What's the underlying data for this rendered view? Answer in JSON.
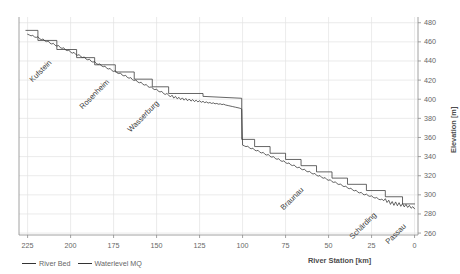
{
  "chart_data": {
    "type": "line",
    "title": "",
    "xlabel": "River Station [km]",
    "ylabel": "Elevation [m]",
    "xlim": [
      230,
      -2
    ],
    "ylim": [
      258,
      486
    ],
    "x_ticks": [
      225,
      200,
      175,
      150,
      125,
      100,
      75,
      50,
      25,
      0
    ],
    "y_ticks": [
      480,
      460,
      440,
      420,
      400,
      380,
      360,
      340,
      320,
      300,
      280,
      260
    ],
    "grid": true,
    "legend_position": "below-left",
    "series": [
      {
        "name": "River Bed",
        "color": "#333333",
        "points": [
          [
            225.0,
            468.0
          ],
          [
            224.0,
            467.2
          ],
          [
            223.0,
            466.3
          ],
          [
            222.0,
            466.8
          ],
          [
            221.0,
            465.2
          ],
          [
            220.0,
            464.6
          ],
          [
            219.0,
            465.4
          ],
          [
            218.0,
            463.2
          ],
          [
            217.0,
            462.4
          ],
          [
            216.0,
            463.0
          ],
          [
            215.0,
            461.0
          ],
          [
            214.0,
            460.2
          ],
          [
            213.0,
            460.8
          ],
          [
            212.0,
            458.6
          ],
          [
            211.0,
            457.8
          ],
          [
            210.0,
            458.4
          ],
          [
            209.0,
            456.4
          ],
          [
            208.0,
            455.6
          ],
          [
            207.0,
            456.2
          ],
          [
            206.0,
            454.0
          ],
          [
            205.0,
            453.2
          ],
          [
            204.0,
            453.8
          ],
          [
            203.0,
            451.6
          ],
          [
            202.0,
            450.8
          ],
          [
            201.0,
            451.4
          ],
          [
            200.0,
            449.2
          ],
          [
            199.0,
            448.2
          ],
          [
            198.0,
            449.0
          ],
          [
            197.0,
            446.8
          ],
          [
            196.0,
            446.0
          ],
          [
            195.0,
            446.6
          ],
          [
            194.0,
            444.4
          ],
          [
            193.0,
            443.6
          ],
          [
            192.0,
            444.2
          ],
          [
            191.0,
            442.0
          ],
          [
            190.0,
            441.2
          ],
          [
            189.0,
            441.8
          ],
          [
            188.0,
            439.6
          ],
          [
            187.0,
            438.8
          ],
          [
            186.0,
            439.4
          ],
          [
            185.0,
            437.2
          ],
          [
            184.0,
            436.4
          ],
          [
            183.0,
            437.0
          ],
          [
            182.0,
            434.8
          ],
          [
            181.0,
            434.0
          ],
          [
            180.0,
            434.6
          ],
          [
            179.0,
            432.4
          ],
          [
            178.0,
            431.6
          ],
          [
            177.0,
            432.2
          ],
          [
            176.0,
            430.0
          ],
          [
            175.0,
            429.0
          ],
          [
            174.0,
            429.8
          ],
          [
            173.0,
            427.6
          ],
          [
            172.0,
            426.8
          ],
          [
            171.0,
            427.4
          ],
          [
            170.0,
            425.2
          ],
          [
            169.0,
            424.4
          ],
          [
            168.0,
            425.0
          ],
          [
            167.0,
            422.8
          ],
          [
            166.0,
            422.0
          ],
          [
            165.0,
            422.6
          ],
          [
            164.0,
            420.4
          ],
          [
            163.0,
            419.6
          ],
          [
            162.0,
            420.2
          ],
          [
            161.0,
            418.0
          ],
          [
            160.0,
            417.2
          ],
          [
            159.0,
            417.8
          ],
          [
            158.0,
            415.6
          ],
          [
            157.0,
            414.8
          ],
          [
            156.0,
            415.4
          ],
          [
            155.0,
            413.2
          ],
          [
            154.0,
            412.4
          ],
          [
            153.0,
            413.0
          ],
          [
            152.0,
            410.8
          ],
          [
            151.0,
            410.0
          ],
          [
            150.0,
            410.6
          ],
          [
            149.0,
            408.4
          ],
          [
            148.0,
            407.6
          ],
          [
            147.0,
            408.2
          ],
          [
            146.0,
            406.0
          ],
          [
            145.0,
            405.0
          ],
          [
            144.0,
            406.0
          ],
          [
            143.0,
            404.4
          ],
          [
            142.0,
            402.4
          ],
          [
            141.0,
            404.2
          ],
          [
            140.0,
            401.2
          ],
          [
            139.0,
            403.0
          ],
          [
            138.0,
            400.4
          ],
          [
            137.0,
            402.0
          ],
          [
            136.0,
            399.6
          ],
          [
            135.0,
            401.4
          ],
          [
            134.0,
            399.0
          ],
          [
            133.0,
            400.8
          ],
          [
            132.0,
            398.4
          ],
          [
            131.0,
            400.2
          ],
          [
            130.0,
            398.0
          ],
          [
            129.0,
            399.6
          ],
          [
            128.0,
            397.6
          ],
          [
            127.0,
            399.0
          ],
          [
            126.0,
            397.2
          ],
          [
            125.0,
            398.4
          ],
          [
            124.0,
            396.8
          ],
          [
            123.0,
            397.8
          ],
          [
            122.0,
            396.4
          ],
          [
            121.0,
            397.2
          ],
          [
            120.0,
            396.0
          ],
          [
            119.0,
            396.6
          ],
          [
            118.0,
            395.6
          ],
          [
            117.0,
            396.2
          ],
          [
            116.0,
            395.2
          ],
          [
            115.0,
            395.6
          ],
          [
            114.0,
            394.8
          ],
          [
            113.0,
            395.2
          ],
          [
            112.0,
            394.4
          ],
          [
            111.0,
            394.8
          ],
          [
            110.0,
            394.0
          ],
          [
            108.0,
            393.2
          ],
          [
            106.0,
            392.4
          ],
          [
            104.0,
            391.6
          ],
          [
            102.0,
            390.8
          ],
          [
            101.0,
            390.2
          ],
          [
            100.5,
            389.6
          ],
          [
            100.0,
            352.0
          ],
          [
            99.0,
            351.2
          ],
          [
            98.0,
            350.4
          ],
          [
            97.0,
            351.0
          ],
          [
            96.0,
            349.0
          ],
          [
            95.0,
            348.2
          ],
          [
            94.0,
            348.8
          ],
          [
            93.0,
            346.8
          ],
          [
            92.0,
            346.0
          ],
          [
            91.0,
            346.6
          ],
          [
            90.0,
            344.6
          ],
          [
            89.0,
            343.8
          ],
          [
            88.0,
            344.4
          ],
          [
            87.0,
            342.4
          ],
          [
            86.0,
            341.6
          ],
          [
            85.0,
            342.2
          ],
          [
            84.0,
            340.2
          ],
          [
            83.0,
            339.4
          ],
          [
            82.0,
            340.0
          ],
          [
            81.0,
            338.0
          ],
          [
            80.0,
            337.2
          ],
          [
            79.0,
            337.8
          ],
          [
            78.0,
            335.8
          ],
          [
            77.0,
            335.0
          ],
          [
            76.0,
            335.6
          ],
          [
            75.0,
            333.6
          ],
          [
            74.0,
            332.8
          ],
          [
            73.0,
            333.4
          ],
          [
            72.0,
            331.4
          ],
          [
            71.0,
            330.6
          ],
          [
            70.0,
            331.2
          ],
          [
            69.0,
            329.2
          ],
          [
            68.0,
            328.4
          ],
          [
            67.0,
            329.0
          ],
          [
            66.0,
            327.0
          ],
          [
            65.0,
            326.2
          ],
          [
            64.0,
            326.8
          ],
          [
            63.0,
            324.8
          ],
          [
            62.0,
            324.0
          ],
          [
            61.0,
            324.6
          ],
          [
            60.0,
            322.6
          ],
          [
            59.0,
            321.8
          ],
          [
            58.0,
            322.4
          ],
          [
            57.0,
            320.4
          ],
          [
            56.0,
            319.6
          ],
          [
            55.0,
            320.2
          ],
          [
            54.0,
            318.2
          ],
          [
            53.0,
            317.4
          ],
          [
            52.0,
            318.0
          ],
          [
            51.0,
            316.0
          ],
          [
            50.0,
            315.2
          ],
          [
            49.0,
            315.8
          ],
          [
            48.0,
            313.8
          ],
          [
            47.0,
            313.0
          ],
          [
            46.0,
            313.6
          ],
          [
            45.0,
            311.6
          ],
          [
            44.0,
            310.8
          ],
          [
            43.0,
            311.4
          ],
          [
            42.0,
            309.4
          ],
          [
            41.0,
            308.6
          ],
          [
            40.0,
            309.2
          ],
          [
            39.0,
            307.2
          ],
          [
            38.0,
            306.4
          ],
          [
            37.0,
            307.0
          ],
          [
            36.0,
            305.0
          ],
          [
            35.0,
            304.2
          ],
          [
            34.0,
            304.8
          ],
          [
            33.0,
            302.8
          ],
          [
            32.0,
            302.0
          ],
          [
            31.0,
            302.6
          ],
          [
            30.0,
            300.6
          ],
          [
            29.0,
            300.0
          ],
          [
            28.0,
            300.8
          ],
          [
            27.0,
            299.2
          ],
          [
            26.0,
            298.4
          ],
          [
            25.0,
            299.0
          ],
          [
            24.0,
            297.4
          ],
          [
            23.0,
            296.6
          ],
          [
            22.0,
            297.2
          ],
          [
            21.0,
            295.6
          ],
          [
            20.0,
            294.8
          ],
          [
            19.0,
            295.6
          ],
          [
            18.0,
            293.8
          ],
          [
            17.0,
            296.0
          ],
          [
            16.0,
            292.0
          ],
          [
            15.0,
            294.4
          ],
          [
            14.0,
            290.0
          ],
          [
            13.0,
            293.0
          ],
          [
            12.0,
            289.0
          ],
          [
            11.0,
            292.6
          ],
          [
            10.0,
            288.6
          ],
          [
            9.0,
            291.8
          ],
          [
            8.0,
            288.0
          ],
          [
            7.0,
            290.8
          ],
          [
            6.0,
            287.4
          ],
          [
            5.0,
            290.0
          ],
          [
            4.0,
            286.8
          ],
          [
            3.0,
            289.0
          ],
          [
            2.0,
            286.0
          ],
          [
            1.0,
            287.6
          ],
          [
            0.0,
            285.4
          ]
        ]
      },
      {
        "name": "Waterlevel MQ",
        "color": "#333333",
        "points": [
          [
            226.0,
            472.0
          ],
          [
            219.0,
            472.0
          ],
          [
            219.0,
            461.5
          ],
          [
            208.0,
            461.5
          ],
          [
            208.0,
            452.0
          ],
          [
            196.5,
            452.0
          ],
          [
            196.5,
            443.5
          ],
          [
            186.0,
            443.5
          ],
          [
            186.0,
            436.0
          ],
          [
            174.0,
            436.0
          ],
          [
            174.0,
            428.5
          ],
          [
            163.0,
            428.5
          ],
          [
            163.0,
            421.0
          ],
          [
            152.5,
            421.0
          ],
          [
            152.5,
            413.0
          ],
          [
            143.0,
            413.0
          ],
          [
            143.0,
            406.0
          ],
          [
            123.0,
            406.0
          ],
          [
            123.0,
            403.0
          ],
          [
            100.5,
            401.0
          ],
          [
            100.5,
            358.0
          ],
          [
            93.0,
            358.0
          ],
          [
            93.0,
            350.5
          ],
          [
            84.0,
            350.5
          ],
          [
            84.0,
            343.5
          ],
          [
            75.0,
            343.5
          ],
          [
            75.0,
            337.0
          ],
          [
            66.0,
            337.0
          ],
          [
            66.0,
            330.5
          ],
          [
            57.0,
            330.5
          ],
          [
            57.0,
            324.0
          ],
          [
            48.0,
            324.0
          ],
          [
            48.0,
            317.5
          ],
          [
            39.0,
            317.5
          ],
          [
            39.0,
            311.0
          ],
          [
            28.0,
            311.0
          ],
          [
            28.0,
            304.5
          ],
          [
            17.0,
            304.5
          ],
          [
            17.0,
            298.0
          ],
          [
            7.0,
            298.0
          ],
          [
            7.0,
            290.5
          ],
          [
            0.0,
            290.5
          ]
        ]
      }
    ],
    "city_annotations": [
      {
        "name": "Kufstein",
        "station_km": 213,
        "rotation": -45
      },
      {
        "name": "Rosenheim",
        "station_km": 184,
        "rotation": -45
      },
      {
        "name": "Wasserburg",
        "station_km": 156,
        "rotation": -45
      },
      {
        "name": "Braunau",
        "station_km": 67,
        "rotation": -45
      },
      {
        "name": "Schärding",
        "station_km": 27,
        "rotation": -45
      },
      {
        "name": "Passau",
        "station_km": 6,
        "rotation": -45
      }
    ]
  },
  "axes": {
    "x_label": "River Station [km]",
    "y_label": "Elevation [m]",
    "x_tick_labels": [
      "225",
      "200",
      "175",
      "150",
      "125",
      "100",
      "75",
      "50",
      "25",
      "0"
    ],
    "y_tick_labels": [
      "480",
      "460",
      "440",
      "420",
      "400",
      "380",
      "360",
      "340",
      "320",
      "300",
      "280",
      "260"
    ]
  },
  "legend": {
    "items": [
      {
        "label": "River Bed",
        "color": "#333333"
      },
      {
        "label": "Waterlevel MQ",
        "color": "#333333"
      }
    ]
  },
  "style": {
    "grid_color": "#e3e3e3",
    "axis_color": "#8c8c8c",
    "line_color": "#333333",
    "text_color": "#666666",
    "background": "#ffffff"
  }
}
